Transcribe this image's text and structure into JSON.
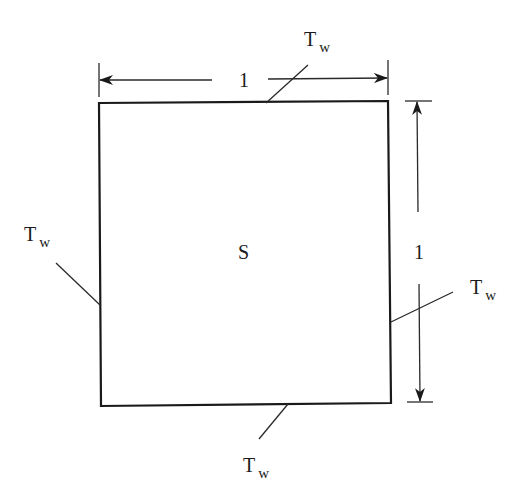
{
  "diagram": {
    "type": "square-domain-with-boundary-conditions",
    "region_label": "S",
    "dimensions": {
      "width_label": "1",
      "height_label": "1"
    },
    "boundary_labels": {
      "top": {
        "main": "T",
        "sub": "w"
      },
      "left": {
        "main": "T",
        "sub": "w"
      },
      "right": {
        "main": "T",
        "sub": "w"
      },
      "bottom": {
        "main": "T",
        "sub": "w"
      }
    },
    "colors": {
      "stroke": "#1a1a1a",
      "background": "#ffffff"
    }
  }
}
